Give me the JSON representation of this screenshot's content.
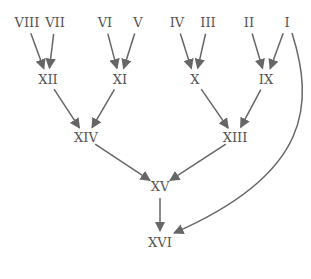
{
  "diagram": {
    "type": "tree",
    "nodes": [
      {
        "id": "VIII",
        "label": "VIII"
      },
      {
        "id": "VII",
        "label": "VII"
      },
      {
        "id": "VI",
        "label": "VI"
      },
      {
        "id": "V",
        "label": "V"
      },
      {
        "id": "IV",
        "label": "IV"
      },
      {
        "id": "III",
        "label": "III"
      },
      {
        "id": "II",
        "label": "II"
      },
      {
        "id": "I",
        "label": "I"
      },
      {
        "id": "XII",
        "label": "XII"
      },
      {
        "id": "XI",
        "label": "XI"
      },
      {
        "id": "X",
        "label": "X"
      },
      {
        "id": "IX",
        "label": "IX"
      },
      {
        "id": "XIV",
        "label": "XIV"
      },
      {
        "id": "XIII",
        "label": "XIII"
      },
      {
        "id": "XV",
        "label": "XV"
      },
      {
        "id": "XVI",
        "label": "XVI"
      }
    ],
    "edges": [
      {
        "from": "VIII",
        "to": "XII"
      },
      {
        "from": "VII",
        "to": "XII"
      },
      {
        "from": "VI",
        "to": "XI"
      },
      {
        "from": "V",
        "to": "XI"
      },
      {
        "from": "IV",
        "to": "X"
      },
      {
        "from": "III",
        "to": "X"
      },
      {
        "from": "II",
        "to": "IX"
      },
      {
        "from": "I",
        "to": "IX"
      },
      {
        "from": "XII",
        "to": "XIV"
      },
      {
        "from": "XI",
        "to": "XIV"
      },
      {
        "from": "X",
        "to": "XIII"
      },
      {
        "from": "IX",
        "to": "XIII"
      },
      {
        "from": "XIV",
        "to": "XV"
      },
      {
        "from": "XIII",
        "to": "XV"
      },
      {
        "from": "XV",
        "to": "XVI"
      },
      {
        "from": "I",
        "to": "XVI",
        "curved": true
      }
    ]
  }
}
